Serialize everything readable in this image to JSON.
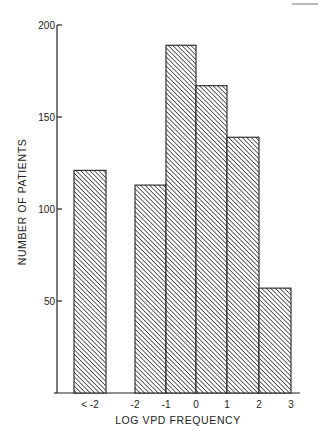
{
  "chart_data": {
    "type": "bar",
    "title": "",
    "xlabel": "LOG  VPD FREQUENCY",
    "ylabel": "NUMBER OF PATIENTS",
    "ylim": [
      0,
      200
    ],
    "yticks": [
      50,
      100,
      150,
      200
    ],
    "ytick_labels": [
      "50",
      "100",
      "150",
      "200"
    ],
    "xtick_labels": [
      "< -2",
      "-2",
      "-1",
      "0",
      "1",
      "2",
      "3"
    ],
    "bins": [
      {
        "label": "< -2",
        "from": null,
        "to": null,
        "value": 121
      },
      {
        "label": "-2 to -1",
        "from": -2,
        "to": -1,
        "value": 113
      },
      {
        "label": "-1 to 0",
        "from": -1,
        "to": 0,
        "value": 189
      },
      {
        "label": "0 to 1",
        "from": 0,
        "to": 1,
        "value": 167
      },
      {
        "label": "1 to 2",
        "from": 1,
        "to": 2,
        "value": 139
      },
      {
        "label": "2 to 3",
        "from": 2,
        "to": 3,
        "value": 57
      }
    ],
    "fill_pattern": "diagonal-hatch",
    "grid": false,
    "legend": "none"
  },
  "colors": {
    "ink": "#222222",
    "background": "#ffffff"
  }
}
